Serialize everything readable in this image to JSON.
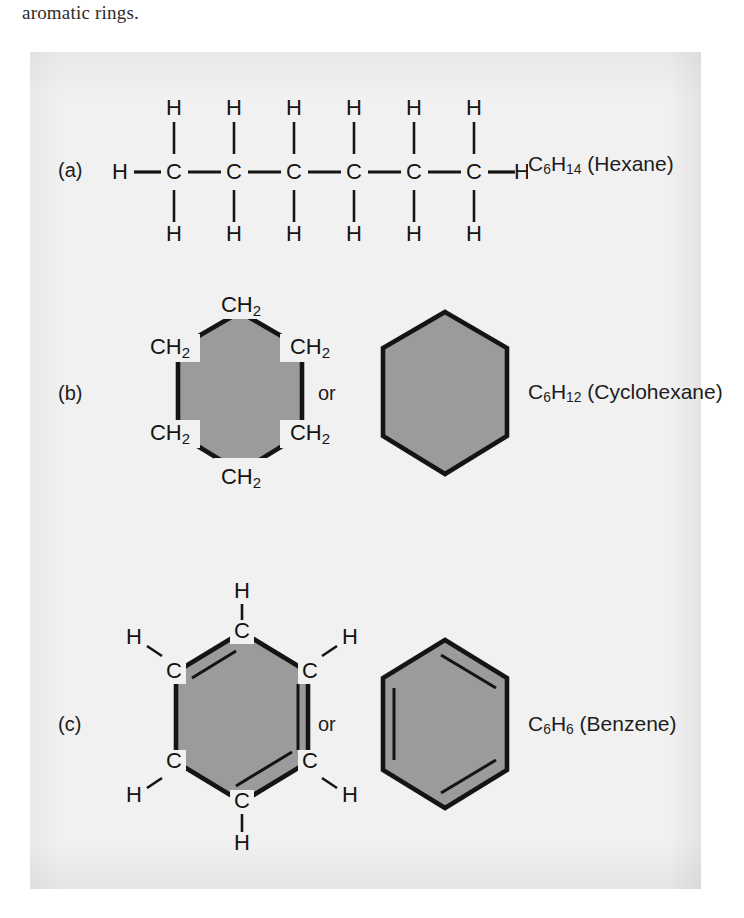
{
  "caption": {
    "text_above_figure": "aromatic rings."
  },
  "figure": {
    "background_color": "#f1f1f1",
    "ring_fill_color": "#9b9b9b",
    "line_color": "#141414",
    "rows": [
      {
        "id": "a",
        "label": "(a)",
        "structure_type": "chain",
        "name": "Hexane",
        "formula_plain": "C6H14",
        "formula_c": "C",
        "formula_c_sub": "6",
        "formula_h": "H",
        "formula_h_sub": "14",
        "formula_suffix": " (Hexane)",
        "carbon_count": 6,
        "carbon_label": "C",
        "hydrogen_label": "H",
        "terminal_hydrogens": [
          "H",
          "H"
        ],
        "top_hydrogens": [
          "H",
          "H",
          "H",
          "H",
          "H",
          "H"
        ],
        "bottom_hydrogens": [
          "H",
          "H",
          "H",
          "H",
          "H",
          "H"
        ],
        "or_label": null
      },
      {
        "id": "b",
        "label": "(b)",
        "structure_type": "ring",
        "name": "Cyclohexane",
        "formula_plain": "C6H12",
        "formula_c": "C",
        "formula_c_sub": "6",
        "formula_h": "H",
        "formula_h_sub": "12",
        "formula_suffix": " (Cyclohexane)",
        "or_label": "or",
        "vertex_labels": [
          "CH2",
          "CH2",
          "CH2",
          "CH2",
          "CH2",
          "CH2"
        ],
        "vertex_base": "CH",
        "vertex_sub": "2",
        "double_bonds": false,
        "skeleton_shown": true
      },
      {
        "id": "c",
        "label": "(c)",
        "structure_type": "ring",
        "name": "Benzene",
        "formula_plain": "C6H6",
        "formula_c": "C",
        "formula_c_sub": "6",
        "formula_h": "H",
        "formula_h_sub": "6",
        "formula_suffix": " (Benzene)",
        "or_label": "or",
        "vertex_labels": [
          "C",
          "C",
          "C",
          "C",
          "C",
          "C"
        ],
        "hydrogen_labels": [
          "H",
          "H",
          "H",
          "H",
          "H",
          "H"
        ],
        "double_bonds": true,
        "skeleton_shown": true
      }
    ]
  }
}
